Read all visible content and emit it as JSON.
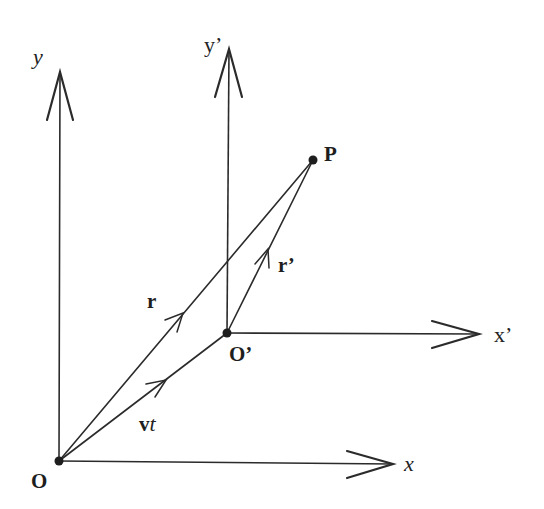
{
  "figure": {
    "colors": {
      "ink": "#2b2b2b",
      "background": "#ffffff"
    }
  },
  "points": {
    "O": {
      "label": "O",
      "x": 59,
      "y": 461
    },
    "O_prime": {
      "label": "O’",
      "x": 227,
      "y": 333
    },
    "P": {
      "label": "P",
      "x": 313,
      "y": 160
    }
  },
  "axes": {
    "x": {
      "label": "x"
    },
    "y": {
      "label": "y"
    },
    "x_prime": {
      "label": "x’"
    },
    "y_prime": {
      "label": "y’"
    }
  },
  "vectors": {
    "r": {
      "label": "r",
      "from": "O",
      "to": "P"
    },
    "r_prime": {
      "label": "r’",
      "from": "O_prime",
      "to": "P"
    },
    "vt": {
      "label_v": "v",
      "label_t": "t",
      "from": "O",
      "to": "O_prime"
    }
  }
}
